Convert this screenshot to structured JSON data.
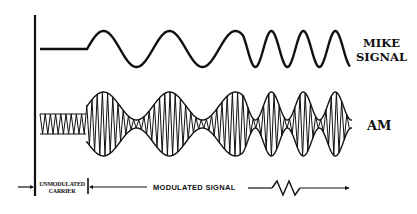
{
  "diagram": {
    "labels": {
      "mike_signal_line1": "MIKE",
      "mike_signal_line2": "SIGNAL",
      "am": "AM",
      "unmodulated_line1": "UNMODULATED",
      "unmodulated_line2": "CARRIER",
      "modulated_signal": "MODULATED   SIGNAL"
    },
    "waveforms": [
      {
        "name": "mike-signal",
        "description": "audio signal: flat, then two slow cycles, then faster cycles"
      },
      {
        "name": "am-signal",
        "description": "carrier with constant amplitude, then amplitude-modulated by the mike signal"
      }
    ],
    "colors": {
      "ink": "#111111",
      "background": "#ffffff"
    }
  }
}
